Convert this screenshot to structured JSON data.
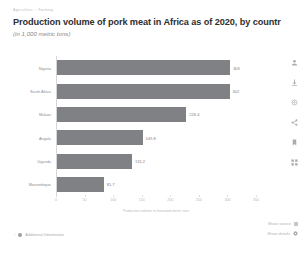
{
  "breadcrumb": {
    "root": "Agriculture",
    "separator": "›",
    "leaf": "Farming"
  },
  "header": {
    "title": "Production volume of pork meat in Africa as of 2020, by countr",
    "subtitle": "(in 1,000 metric tons)"
  },
  "chart_data": {
    "type": "bar",
    "orientation": "horizontal",
    "subtitle": "(in 1,000 metric tons)",
    "xlabel": "Production volume in thousand metric tons",
    "ylabel": "",
    "categories": [
      "Nigeria",
      "South Africa",
      "Malawi",
      "Angola",
      "Uganda",
      "Mozambique"
    ],
    "values": [
      303,
      302,
      226.4,
      149.8,
      131.2,
      81.7
    ],
    "value_labels": [
      "303",
      "302",
      "226.4",
      "149.8",
      "131.2",
      "81.7"
    ],
    "xlim": [
      0,
      350
    ],
    "xticks": [
      0,
      50,
      100,
      150,
      200,
      250,
      300,
      350
    ],
    "xtick_labels": [
      "0",
      "50",
      "100",
      "150",
      "200",
      "250",
      "300",
      "350"
    ],
    "grid": false,
    "legend": false,
    "bar_color": "#7f8185"
  },
  "rail": {
    "icons": [
      {
        "name": "user-icon",
        "label": "Account"
      },
      {
        "name": "download-icon",
        "label": "Download"
      },
      {
        "name": "settings-icon",
        "label": "Settings"
      },
      {
        "name": "share-icon",
        "label": "Share"
      },
      {
        "name": "bookmark-icon",
        "label": "Bookmark"
      },
      {
        "name": "grid-icon",
        "label": "More"
      }
    ]
  },
  "footer": {
    "additional_information": "Additional Information",
    "show_source": "Show source",
    "show_details": "Show details"
  }
}
